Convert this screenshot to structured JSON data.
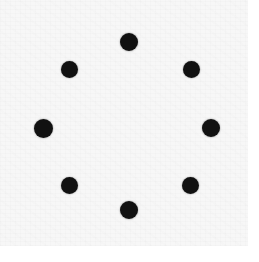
{
  "figure": {
    "kind": "dot-pattern-image",
    "canvas": {
      "width": 259,
      "height": 262,
      "background_color": "#ffffff"
    },
    "paper": {
      "x": 0,
      "y": 0,
      "width": 248,
      "height": 246,
      "color": "#f7f7f7",
      "texture": "scan-noise"
    },
    "dot_style": {
      "color": "#111111",
      "shape": "circle",
      "diameter": 18,
      "count": 8
    },
    "dots": [
      {
        "name": "dot-top",
        "position": "top",
        "cx": 129,
        "cy": 42,
        "r": 9,
        "angle_deg": 90
      },
      {
        "name": "dot-top-right",
        "position": "top-right",
        "cx": 191,
        "cy": 69,
        "r": 8.5,
        "angle_deg": 45
      },
      {
        "name": "dot-right",
        "position": "right",
        "cx": 211,
        "cy": 128,
        "r": 9,
        "angle_deg": 0
      },
      {
        "name": "dot-bottom-right",
        "position": "bottom-right",
        "cx": 190,
        "cy": 185,
        "r": 8.5,
        "angle_deg": 315
      },
      {
        "name": "dot-bottom",
        "position": "bottom",
        "cx": 129,
        "cy": 210,
        "r": 9,
        "angle_deg": 270
      },
      {
        "name": "dot-bottom-left",
        "position": "bottom-left",
        "cx": 69,
        "cy": 185,
        "r": 8.5,
        "angle_deg": 225
      },
      {
        "name": "dot-left",
        "position": "left",
        "cx": 43,
        "cy": 128,
        "r": 9.5,
        "angle_deg": 180
      },
      {
        "name": "dot-top-left",
        "position": "top-left",
        "cx": 69,
        "cy": 69,
        "r": 8.5,
        "angle_deg": 135
      }
    ],
    "pattern": {
      "center_x": 127,
      "center_y": 126,
      "radius": 84,
      "symmetry": "8-fold rotational"
    }
  }
}
